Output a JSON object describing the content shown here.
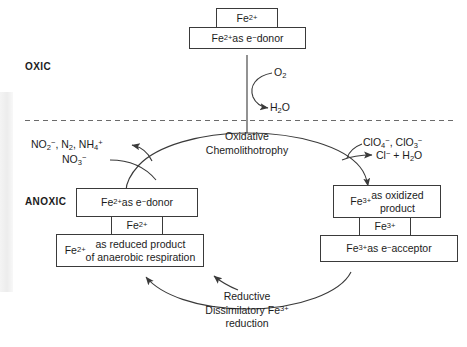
{
  "figure": {
    "type": "cycle-diagram",
    "zones": [
      {
        "id": "oxic",
        "label": "OXIC"
      },
      {
        "id": "anoxic",
        "label": "ANOXIC"
      }
    ],
    "boundary": {
      "style": "dashed",
      "description": "oxic-anoxic interface"
    }
  },
  "nodes": {
    "fe2_top_tag": {
      "html": "Fe<sup>2+</sup>"
    },
    "fe2_donor_top": {
      "html": "Fe<sup>2+</sup> as e<sup>−</sup> donor"
    },
    "fe2_donor_anoxic": {
      "html": "Fe<sup>2+</sup> as e<sup>−</sup> donor"
    },
    "fe2_tag": {
      "html": "Fe<sup>2+</sup>"
    },
    "fe2_reduced": {
      "html": "Fe<sup>2+</sup> as reduced product<br>of anaerobic respiration"
    },
    "fe3_oxidized": {
      "html": "Fe<sup>3+</sup> as oxidized<br>product"
    },
    "fe3_tag": {
      "html": "Fe<sup>3+</sup>"
    },
    "fe3_acceptor": {
      "html": "Fe<sup>3+</sup> as e<sup>−</sup> acceptor"
    }
  },
  "reactants": {
    "oxygen": {
      "html": "O<sub>2</sub>"
    },
    "water": {
      "html": "H<sub>2</sub>O"
    },
    "nitrogen_species": {
      "html": "NO<sub>2</sub><sup>−</sup>, N<sub>2</sub>, NH<sub>4</sub><sup>+</sup>"
    },
    "nitrate": {
      "html": "NO<sub>3</sub><sup>−</sup>"
    },
    "chlorine_oxides": {
      "html": "ClO<sub>4</sub><sup>−</sup>, ClO<sub>3</sub><sup>−</sup>"
    },
    "chloride_water": {
      "html": "Cl<sup>−</sup> + H<sub>2</sub>O"
    }
  },
  "pathways": {
    "top": {
      "html": "Oxidative<br>Chemolithotrophy"
    },
    "bottom": {
      "html": "Reductive<br>Dissimilatory Fe<sup>3+</sup><br>reduction"
    }
  },
  "colors": {
    "stroke": "#3a3a3a",
    "text": "#1c1c1c",
    "background": "#ffffff"
  }
}
